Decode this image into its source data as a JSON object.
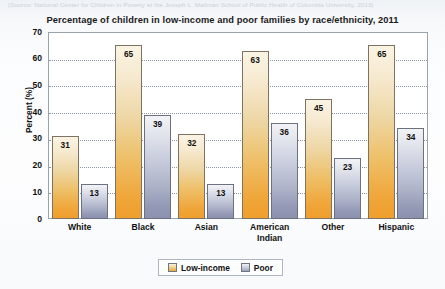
{
  "source_note": "(Source: National Center for Children in Poverty at the Joseph L. Mailman School of Public Health of Columbia University, 2013)",
  "chart_data": {
    "type": "bar",
    "title": "Percentage of children in low-income and poor families by race/ethnicity, 2011",
    "xlabel": "",
    "ylabel": "Percent (%)",
    "ylim": [
      0,
      70
    ],
    "ytick_step": 10,
    "yticks": [
      "0",
      "10",
      "20",
      "30",
      "40",
      "50",
      "60",
      "70"
    ],
    "grid": true,
    "grid_style": "dotted-horizontal",
    "legend_position": "bottom-center",
    "categories": [
      "White",
      "Black",
      "Asian",
      "American Indian",
      "Other",
      "Hispanic"
    ],
    "category_lines": [
      [
        "White"
      ],
      [
        "Black"
      ],
      [
        "Asian"
      ],
      [
        "American",
        "Indian"
      ],
      [
        "Other"
      ],
      [
        "Hispanic"
      ]
    ],
    "series": [
      {
        "name": "Low-income",
        "color": "#efa63a",
        "values": [
          31,
          65,
          32,
          63,
          45,
          65
        ]
      },
      {
        "name": "Poor",
        "color": "#949ab6",
        "values": [
          13,
          39,
          13,
          36,
          23,
          34
        ]
      }
    ]
  },
  "legend": {
    "items": [
      {
        "label": "Low-income",
        "swatch": "low"
      },
      {
        "label": "Poor",
        "swatch": "poor"
      }
    ]
  },
  "colors": {
    "low_income_top": "#fbf4e3",
    "low_income_bottom": "#ef9f2c",
    "poor_top": "#f2f3f6",
    "poor_bottom": "#8b91ae",
    "axis": "#9aa3ad",
    "grid": "#8e98a3",
    "text": "#111111",
    "page_background": "#f7f9fb"
  }
}
